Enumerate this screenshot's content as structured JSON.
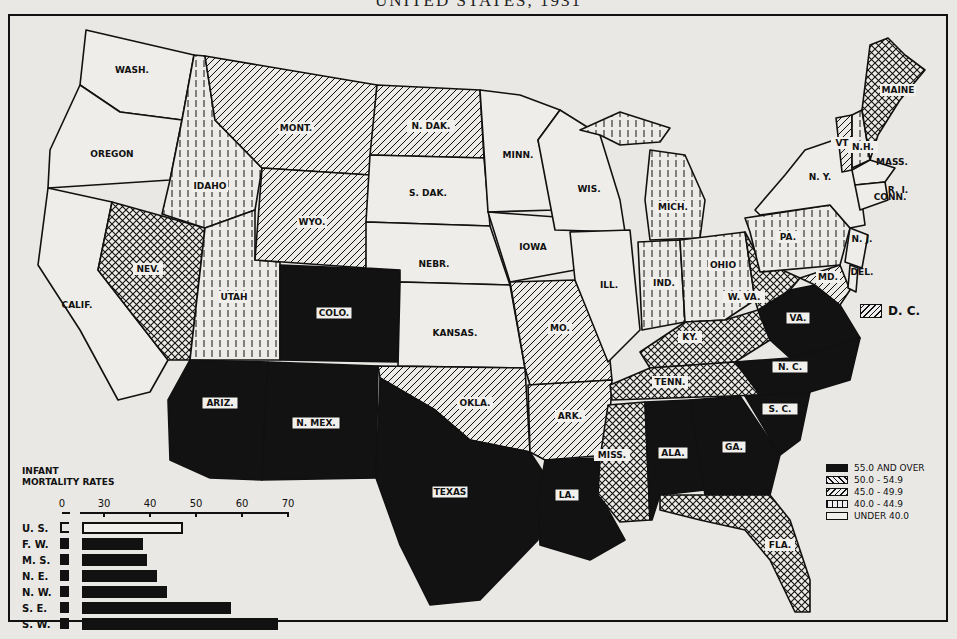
{
  "title": "UNITED STATES, 1931",
  "map": {
    "states": [
      {
        "abbr": "WASH.",
        "class": "under-40",
        "x": 132,
        "y": 73
      },
      {
        "abbr": "OREGON",
        "class": "under-40",
        "x": 112,
        "y": 157
      },
      {
        "abbr": "CALIF.",
        "class": "under-40",
        "x": 77,
        "y": 308
      },
      {
        "abbr": "IDAHO",
        "class": "40-44.9",
        "x": 210,
        "y": 189
      },
      {
        "abbr": "NEV.",
        "class": "50-54.9",
        "x": 148,
        "y": 272
      },
      {
        "abbr": "UTAH",
        "class": "40-44.9",
        "x": 234,
        "y": 300
      },
      {
        "abbr": "MONT.",
        "class": "45-49.9",
        "x": 296,
        "y": 131
      },
      {
        "abbr": "WYO.",
        "class": "45-49.9",
        "x": 312,
        "y": 225
      },
      {
        "abbr": "COLO.",
        "class": "55-over",
        "x": 334,
        "y": 316
      },
      {
        "abbr": "ARIZ.",
        "class": "55-over",
        "x": 220,
        "y": 406
      },
      {
        "abbr": "N. MEX.",
        "class": "55-over",
        "x": 316,
        "y": 426
      },
      {
        "abbr": "N. DAK.",
        "class": "45-49.9",
        "x": 431,
        "y": 129
      },
      {
        "abbr": "S. DAK.",
        "class": "under-40",
        "x": 428,
        "y": 196
      },
      {
        "abbr": "NEBR.",
        "class": "under-40",
        "x": 434,
        "y": 267
      },
      {
        "abbr": "KANSAS.",
        "class": "under-40",
        "x": 455,
        "y": 336
      },
      {
        "abbr": "OKLA.",
        "class": "45-49.9",
        "x": 475,
        "y": 406
      },
      {
        "abbr": "TEXAS",
        "class": "55-over",
        "x": 450,
        "y": 495
      },
      {
        "abbr": "MINN.",
        "class": "under-40",
        "x": 518,
        "y": 158
      },
      {
        "abbr": "IOWA",
        "class": "under-40",
        "x": 533,
        "y": 250
      },
      {
        "abbr": "MO.",
        "class": "45-49.9",
        "x": 560,
        "y": 331
      },
      {
        "abbr": "ARK.",
        "class": "45-49.9",
        "x": 570,
        "y": 419
      },
      {
        "abbr": "LA.",
        "class": "55-over",
        "x": 567,
        "y": 498
      },
      {
        "abbr": "WIS.",
        "class": "under-40",
        "x": 589,
        "y": 192
      },
      {
        "abbr": "ILL.",
        "class": "under-40",
        "x": 609,
        "y": 288
      },
      {
        "abbr": "MICH.",
        "class": "40-44.9",
        "x": 673,
        "y": 210
      },
      {
        "abbr": "IND.",
        "class": "40-44.9",
        "x": 664,
        "y": 286
      },
      {
        "abbr": "OHIO",
        "class": "40-44.9",
        "x": 723,
        "y": 268
      },
      {
        "abbr": "KY.",
        "class": "50-54.9",
        "x": 690,
        "y": 340
      },
      {
        "abbr": "TENN.",
        "class": "50-54.9",
        "x": 670,
        "y": 385
      },
      {
        "abbr": "MISS.",
        "class": "50-54.9",
        "x": 612,
        "y": 458
      },
      {
        "abbr": "ALA.",
        "class": "55-over",
        "x": 673,
        "y": 456
      },
      {
        "abbr": "GA.",
        "class": "55-over",
        "x": 734,
        "y": 450
      },
      {
        "abbr": "FLA.",
        "class": "50-54.9",
        "x": 780,
        "y": 548
      },
      {
        "abbr": "S. C.",
        "class": "55-over",
        "x": 780,
        "y": 412
      },
      {
        "abbr": "N. C.",
        "class": "55-over",
        "x": 790,
        "y": 370
      },
      {
        "abbr": "VA.",
        "class": "55-over",
        "x": 798,
        "y": 321
      },
      {
        "abbr": "W. VA.",
        "class": "50-54.9",
        "x": 744,
        "y": 300
      },
      {
        "abbr": "PA.",
        "class": "40-44.9",
        "x": 788,
        "y": 240
      },
      {
        "abbr": "N. Y.",
        "class": "under-40",
        "x": 820,
        "y": 180
      },
      {
        "abbr": "N. J.",
        "class": "under-40",
        "x": 862,
        "y": 242
      },
      {
        "abbr": "DEL.",
        "class": "under-40",
        "x": 862,
        "y": 275
      },
      {
        "abbr": "MD.",
        "class": "45-49.9",
        "x": 828,
        "y": 280
      },
      {
        "abbr": "VT.",
        "class": "45-49.9",
        "x": 843,
        "y": 146
      },
      {
        "abbr": "N.H.",
        "class": "40-44.9",
        "x": 863,
        "y": 150
      },
      {
        "abbr": "MAINE",
        "class": "50-54.9",
        "x": 898,
        "y": 93
      },
      {
        "abbr": "MASS.",
        "class": "under-40",
        "x": 892,
        "y": 165
      },
      {
        "abbr": "R. I.",
        "class": "under-40",
        "x": 898,
        "y": 193
      },
      {
        "abbr": "CONN.",
        "class": "under-40",
        "x": 890,
        "y": 200
      }
    ],
    "dc_label": "D. C.",
    "dc_class": "45-49.9"
  },
  "legend": {
    "items": [
      {
        "label": "55.0 AND OVER",
        "class": "55-over"
      },
      {
        "label": "50.0 - 54.9",
        "class": "50-54.9"
      },
      {
        "label": "45.0 - 49.9",
        "class": "45-49.9"
      },
      {
        "label": "40.0 - 44.9",
        "class": "40-44.9"
      },
      {
        "label": "UNDER 40.0",
        "class": "under-40"
      }
    ]
  },
  "chart_data": {
    "type": "bar",
    "orientation": "horizontal",
    "title": "INFANT MORTALITY RATES",
    "title_lines": [
      "INFANT",
      "MORTALITY RATES"
    ],
    "xlabel": "",
    "ylabel": "",
    "xlim": [
      0,
      70
    ],
    "x_ticks": [
      "0",
      "30",
      "40",
      "50",
      "60",
      "70"
    ],
    "axis_break": "between 0 and 30",
    "categories": [
      "U. S.",
      "F. W.",
      "M. S.",
      "N. E.",
      "N. W.",
      "S. E.",
      "S. W."
    ],
    "values": [
      47.2,
      38.5,
      39.4,
      41.5,
      43.6,
      57.5,
      67.8
    ],
    "bar_styles": [
      "open",
      "solid",
      "solid",
      "solid",
      "solid",
      "solid",
      "solid"
    ],
    "grid": false,
    "legend_position": "none"
  }
}
